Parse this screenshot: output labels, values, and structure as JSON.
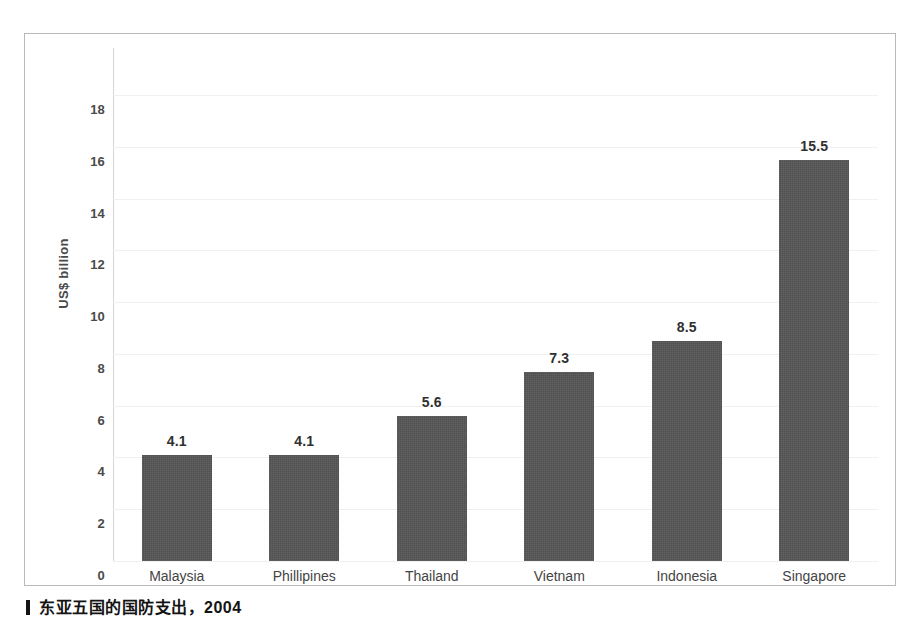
{
  "chart_data": {
    "type": "bar",
    "title": "",
    "subtitle": "",
    "xlabel": "",
    "ylabel": "US$ billion",
    "ylim": [
      0,
      19
    ],
    "grid": true,
    "legend": "none",
    "categories": [
      "Malaysia",
      "Phillipines",
      "Thailand",
      "Vietnam",
      "Indonesia",
      "Singapore"
    ],
    "values": [
      4.1,
      4.1,
      5.6,
      7.3,
      8.5,
      15.5
    ],
    "value_labels": [
      "4.1",
      "4.1",
      "5.6",
      "7.3",
      "8.5",
      "15.5"
    ],
    "y_ticks": [
      18,
      16,
      14,
      12,
      10,
      8,
      6,
      4,
      2,
      0
    ],
    "y_tick_labels": [
      "18",
      "16",
      "14",
      "12",
      "10",
      "8",
      "6",
      "4",
      "2",
      "0"
    ],
    "series": [
      {
        "name": "Defence expenditure",
        "values": [
          4.1,
          4.1,
          5.6,
          7.3,
          8.5,
          15.5
        ]
      }
    ],
    "bar_color": "#565656"
  },
  "colors": {
    "bar": "#565656",
    "gridline": "#f0f0f0",
    "frame_border": "#b9b9b9",
    "axis_line": "#d6d6d6",
    "tick_text": "#4a4a4a",
    "value_text": "#303030",
    "category_text": "#444444",
    "caption_text": "#141414",
    "background": "#ffffff"
  },
  "caption": {
    "text": "东亚五国的国防支出，2004"
  }
}
